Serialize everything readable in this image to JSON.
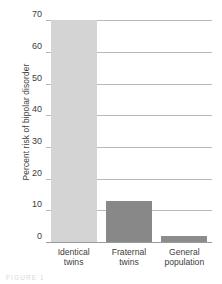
{
  "chart_data": {
    "type": "bar",
    "title": "",
    "subtitle": "",
    "xlabel": "",
    "ylabel": "Percent risk of bipolar disorder",
    "categories": [
      "Identical twins",
      "Fraternal twins",
      "General population"
    ],
    "category_lines": [
      [
        "Identical",
        "twins"
      ],
      [
        "Fraternal",
        "twins"
      ],
      [
        "General",
        "population"
      ]
    ],
    "values": [
      70,
      13,
      2
    ],
    "ylim": [
      0,
      72
    ],
    "yticks": [
      0,
      10,
      20,
      30,
      40,
      50,
      60,
      70
    ],
    "ytick_labels": [
      "0",
      "10",
      "20",
      "30",
      "40",
      "50",
      "60",
      "70"
    ],
    "grid": true,
    "legend": false,
    "bar_colors": [
      "#d4d4d4",
      "#888888",
      "#8c8c8c"
    ]
  },
  "colors": {
    "gridline": "#b9b9b9",
    "axis": "#9a9a9a",
    "text": "#3d3d3d",
    "background": "#ffffff"
  },
  "caption": {
    "text": "FIGURE 1"
  }
}
